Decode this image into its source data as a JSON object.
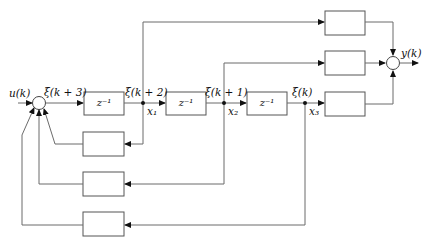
{
  "diagram": {
    "type": "block-diagram",
    "input_label": "u(k)",
    "output_label": "y(k)",
    "signals": {
      "s3": "ξ(k + 3)",
      "s2": "ξ(k + 2)",
      "s1": "ξ(k + 1)",
      "s0": "ξ(k)"
    },
    "states": {
      "x1": "x₁",
      "x2": "x₂",
      "x3": "x₃"
    },
    "delay_blocks": [
      {
        "label": "z⁻¹"
      },
      {
        "label": "z⁻¹"
      },
      {
        "label": "z⁻¹"
      }
    ],
    "feedforward_blocks": [
      {
        "label": ""
      },
      {
        "label": ""
      },
      {
        "label": ""
      }
    ],
    "feedback_blocks": [
      {
        "label": ""
      },
      {
        "label": ""
      },
      {
        "label": ""
      }
    ],
    "summing_junctions": [
      "input-sum",
      "output-sum"
    ],
    "line_color": "#6b6b6b",
    "box_color": "#555555"
  }
}
